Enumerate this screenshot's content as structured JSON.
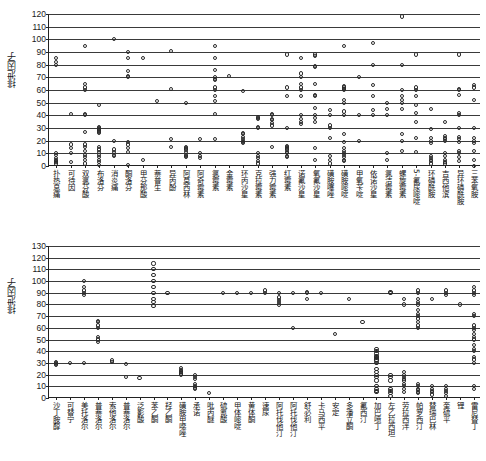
{
  "chart_data": [
    {
      "id": "top",
      "type": "scatter",
      "title": "",
      "xlabel": "",
      "ylabel": "排泄因子",
      "ylim": [
        0,
        120
      ],
      "ytick_step": 10,
      "yticks": [
        0,
        10,
        20,
        30,
        40,
        50,
        60,
        70,
        80,
        90,
        100,
        110,
        120
      ],
      "grid": "horizontal",
      "legend": "none",
      "categories": [
        "扑热息痛",
        "可待因",
        "双氯芬酸",
        "布洛芬",
        "消炎痛",
        "酮洛芬",
        "甲芬那酸",
        "萘普生",
        "异丙酚",
        "阿莫西林",
        "阿奇霉素",
        "氯霉素",
        "金霉素",
        "环丙沙星",
        "克拉霉素",
        "强力霉素",
        "红霉素",
        "诺氟沙星",
        "氧氟沙星",
        "磺胺噻唑",
        "磺胺嘧啶",
        "甲氧苄啶",
        "依诺沙星",
        "氯洁霉素",
        "螺旋霉素",
        "5-氟尿嘧啶",
        "环磷酰胺",
        "吉西他滨",
        "异环磷酰胺",
        "三苯氧胺"
      ],
      "values": [
        [
          2,
          3,
          4,
          5,
          6,
          9,
          10,
          80,
          82,
          85
        ],
        [
          3,
          10,
          14,
          17,
          41
        ],
        [
          2,
          5,
          7,
          9,
          12,
          15,
          17,
          27,
          40,
          41,
          60,
          62,
          65,
          95
        ],
        [
          1,
          3,
          5,
          7,
          9,
          11,
          13,
          15,
          26,
          27,
          28,
          29,
          30,
          31,
          48
        ],
        [
          8,
          9,
          11,
          13,
          20,
          100
        ],
        [
          1,
          11,
          14,
          17,
          19,
          70,
          71,
          75,
          85,
          90
        ],
        [
          5,
          85
        ],
        [
          51
        ],
        [
          15,
          21,
          61,
          91
        ],
        [
          7,
          8,
          9,
          11,
          13,
          14,
          15,
          50
        ],
        [
          6,
          8,
          10,
          21
        ],
        [
          21,
          41,
          51,
          55,
          60,
          62,
          68,
          69,
          70,
          76,
          85,
          95
        ],
        [
          71
        ],
        [
          18,
          19,
          20,
          21,
          23,
          25,
          26,
          59
        ],
        [
          2,
          4,
          6,
          8,
          10,
          30,
          31,
          37,
          38,
          39
        ],
        [
          15,
          32,
          34,
          36,
          37,
          40,
          41
        ],
        [
          7,
          8,
          10,
          11,
          13,
          14,
          15,
          16,
          30,
          55,
          62,
          88
        ],
        [
          33,
          35,
          37,
          40,
          55,
          60,
          62,
          65,
          70,
          73,
          85
        ],
        [
          5,
          14,
          35,
          38,
          40,
          46,
          55,
          56,
          65,
          78,
          79,
          87,
          88
        ],
        [
          2,
          5,
          8,
          22,
          30,
          32,
          40,
          44
        ],
        [
          4,
          5,
          7,
          9,
          10,
          12,
          14,
          19,
          25,
          40,
          43,
          50,
          52,
          60,
          61,
          62,
          63,
          95
        ],
        [
          20,
          40,
          70
        ],
        [
          40,
          44,
          55,
          64,
          80,
          97
        ],
        [
          5,
          10,
          40,
          45,
          50
        ],
        [
          12,
          20,
          25,
          45,
          50,
          52,
          55,
          60,
          80,
          118
        ],
        [
          11,
          22,
          35,
          42,
          48,
          55,
          60,
          62,
          88
        ],
        [
          2,
          4,
          5,
          6,
          8,
          18,
          20,
          22,
          29,
          45
        ],
        [
          2,
          3,
          5,
          8,
          10,
          20,
          21,
          22,
          24,
          35
        ],
        [
          4,
          7,
          10,
          12,
          19,
          21,
          23,
          30,
          40,
          42,
          56,
          60,
          61,
          88
        ],
        [
          0,
          5,
          12,
          18,
          20,
          22,
          30,
          52,
          62,
          64
        ]
      ]
    },
    {
      "id": "bottom",
      "type": "scatter",
      "title": "",
      "xlabel": "",
      "ylabel": "排泄因子",
      "ylim": [
        0,
        130
      ],
      "ytick_step": 10,
      "yticks": [
        0,
        10,
        20,
        30,
        40,
        50,
        60,
        70,
        80,
        90,
        100,
        110,
        120,
        130
      ],
      "grid": "horizontal",
      "legend": "none",
      "categories": [
        "沙丁胺醇",
        "可替宁",
        "美托洛尔",
        "普萘洛尔",
        "索他洛尔",
        "普萘洛尔",
        "泛影酸",
        "苯乙酮",
        "羟乙酮",
        "磺胺甲噁唑",
        "承诺",
        "吡丙醚",
        "硫氰酸",
        "甲体嘧啶",
        "黄体酮",
        "速尿",
        "阿托伐他汀",
        "阿托伐他汀",
        "舒必利",
        "卡马西平",
        "安定",
        "多潘立酮",
        "氟西汀",
        "加巴喷丁",
        "左乙拉西坦",
        "劳拉西泮",
        "帕罗西汀",
        "替瑞巴林",
        "奎硫平",
        "锂",
        "雷尼替丁"
      ],
      "values": [
        [
          28,
          29,
          30,
          31
        ],
        [
          30
        ],
        [
          30,
          88,
          90,
          92,
          95,
          100
        ],
        [
          48,
          50,
          52,
          60,
          62,
          65,
          66
        ],
        [
          31,
          32
        ],
        [
          18,
          29
        ],
        [
          17
        ],
        [
          79,
          82,
          85,
          90,
          95,
          100,
          105,
          110,
          115
        ],
        [
          90
        ],
        [
          20,
          21,
          22,
          23,
          24,
          26
        ],
        [
          8,
          9,
          10,
          12,
          16,
          18,
          20
        ],
        [
          4
        ],
        [
          90
        ],
        [
          90
        ],
        [
          90
        ],
        [
          90,
          92
        ],
        [
          80,
          82,
          84,
          86,
          90
        ],
        [
          60,
          90
        ],
        [
          85,
          90,
          91
        ],
        [
          90
        ],
        [
          55
        ],
        [
          85
        ],
        [
          65
        ],
        [
          5,
          6,
          8,
          10,
          15,
          18,
          20,
          22,
          25,
          30,
          32,
          33,
          34,
          35,
          36,
          38,
          40,
          42
        ],
        [
          2,
          4,
          6,
          8,
          15,
          18,
          20,
          90,
          91
        ],
        [
          5,
          8,
          10,
          12,
          15,
          16,
          18,
          20,
          22,
          80,
          85
        ],
        [
          4,
          5,
          7,
          8,
          10,
          12,
          60,
          62,
          65,
          68,
          70,
          72,
          75,
          80,
          82,
          85,
          90,
          92
        ],
        [
          3,
          5,
          6,
          8,
          10,
          85
        ],
        [
          2,
          4,
          6,
          8,
          10,
          88,
          90,
          92
        ],
        [
          80
        ],
        [
          8,
          10,
          30,
          33,
          35,
          40,
          42,
          45,
          50,
          52,
          55,
          58,
          60,
          62,
          70,
          72,
          88,
          90,
          92,
          95
        ]
      ]
    }
  ]
}
